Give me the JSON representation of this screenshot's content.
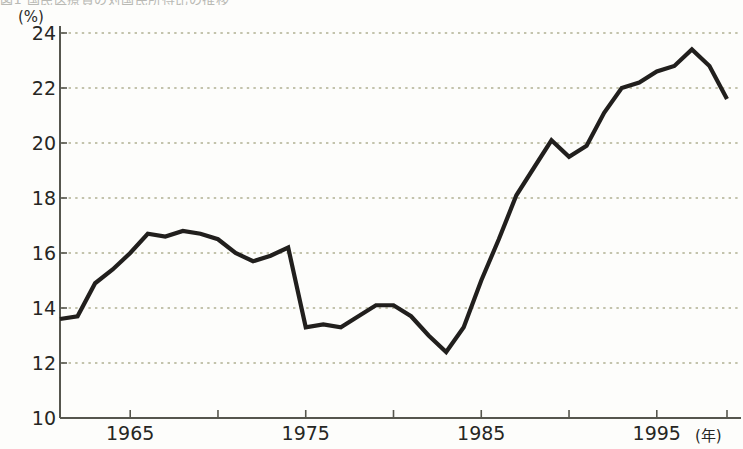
{
  "clipped_caption": "図1 国民医療費の対国民所得比の推移",
  "chart_data": {
    "type": "line",
    "title": "",
    "subtitle": "",
    "xlabel": "(年)",
    "ylabel": "(%)",
    "xlim": [
      1961,
      1999
    ],
    "ylim": [
      10,
      24
    ],
    "grid": true,
    "grid_style": "dotted",
    "legend": "none",
    "ytick_labels": [
      "24",
      "22",
      "20",
      "18",
      "16",
      "14",
      "12",
      "10"
    ],
    "yticks": [
      24,
      22,
      20,
      18,
      16,
      14,
      12,
      10
    ],
    "xtick_labels": [
      "1965",
      "1975",
      "1985",
      "1995"
    ],
    "xticks": [
      1965,
      1975,
      1985,
      1995
    ],
    "xtick_minor": [
      1970,
      1980,
      1990,
      1999
    ],
    "line_color": "#211f1d",
    "grid_color": "#8a8a5e",
    "axis_color": "#56564e",
    "series": [
      {
        "name": "比率",
        "x": [
          1961,
          1962,
          1963,
          1964,
          1965,
          1966,
          1967,
          1968,
          1969,
          1970,
          1971,
          1972,
          1973,
          1974,
          1975,
          1976,
          1977,
          1978,
          1979,
          1980,
          1981,
          1982,
          1983,
          1984,
          1985,
          1986,
          1987,
          1988,
          1989,
          1990,
          1991,
          1992,
          1993,
          1994,
          1995,
          1996,
          1997,
          1998,
          1999
        ],
        "values": [
          13.6,
          13.7,
          14.9,
          15.4,
          16.0,
          16.7,
          16.6,
          16.8,
          16.7,
          16.5,
          16.0,
          15.7,
          15.9,
          16.2,
          13.3,
          13.4,
          13.3,
          13.7,
          14.1,
          14.1,
          13.7,
          13.0,
          12.4,
          13.3,
          15.0,
          16.5,
          18.1,
          19.1,
          20.1,
          19.5,
          19.9,
          21.1,
          22.0,
          22.2,
          22.6,
          22.8,
          23.4,
          22.8,
          21.6
        ]
      }
    ]
  }
}
